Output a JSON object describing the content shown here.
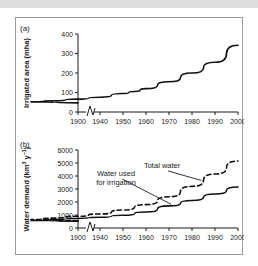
{
  "figure": {
    "panel_a_tag": "(a)",
    "panel_b_tag": "(b)"
  },
  "chart_data": [
    {
      "type": "line",
      "panel": "(a)",
      "title": "",
      "xlabel": "",
      "ylabel": "Irrigated area (mha)",
      "xlim": [
        1900,
        2000
      ],
      "ylim": [
        0,
        400
      ],
      "axis_break_after": 1900,
      "grid": false,
      "legend": "none",
      "xticks": [
        1900,
        1940,
        1950,
        1960,
        1970,
        1980,
        1990,
        2000
      ],
      "xticklabels": [
        "1900",
        "1940",
        "1950",
        "1960",
        "1970",
        "1980",
        "1990",
        "2000"
      ],
      "yticks": [
        0,
        100,
        200,
        300,
        400
      ],
      "yticklabels": [
        "0",
        "100",
        "200",
        "300",
        "400"
      ],
      "series": [
        {
          "name": "Irrigated area",
          "style": "solid",
          "x": [
            1900,
            1910,
            1920,
            1930,
            1940,
            1950,
            1955,
            1960,
            1970,
            1980,
            1990,
            2000
          ],
          "values": [
            47,
            52,
            58,
            66,
            76,
            95,
            105,
            120,
            155,
            200,
            255,
            342
          ]
        }
      ]
    },
    {
      "type": "line",
      "panel": "(b)",
      "title": "",
      "xlabel": "",
      "ylabel": "Water demand (km³ y⁻¹)",
      "xlim": [
        1900,
        2000
      ],
      "ylim": [
        0,
        6000
      ],
      "axis_break_after": 1900,
      "grid": false,
      "legend": "inline-annotations",
      "xticks": [
        1900,
        1940,
        1950,
        1960,
        1970,
        1980,
        1990,
        2000
      ],
      "xticklabels": [
        "1900",
        "1940",
        "1950",
        "1960",
        "1970",
        "1980",
        "1990",
        "2000"
      ],
      "yticks": [
        0,
        1000,
        2000,
        3000,
        4000,
        5000,
        6000
      ],
      "yticklabels": [
        "0",
        "1000",
        "2000",
        "3000",
        "4000",
        "5000",
        "6000"
      ],
      "series": [
        {
          "name": "Total water",
          "style": "dashed",
          "x": [
            1900,
            1910,
            1920,
            1930,
            1940,
            1950,
            1960,
            1970,
            1980,
            1990,
            2000
          ],
          "values": [
            550,
            650,
            760,
            900,
            1080,
            1380,
            1800,
            2400,
            3200,
            4150,
            5150
          ]
        },
        {
          "name": "Water used for irrigation",
          "style": "solid",
          "x": [
            1900,
            1910,
            1920,
            1930,
            1940,
            1950,
            1960,
            1970,
            1980,
            1990,
            2000
          ],
          "values": [
            520,
            580,
            650,
            730,
            830,
            980,
            1230,
            1700,
            2120,
            2620,
            3150
          ]
        }
      ],
      "annotations": [
        {
          "text": "Total water",
          "target_series": "Total water",
          "target_x": 1984,
          "label_x": 1967,
          "label_y": 4620
        },
        {
          "text_line1": "Water used",
          "text_line2": "for irrigation",
          "target_series": "Water used for irrigation",
          "target_x": 1971,
          "label_x": 1947,
          "label_y": 4000
        }
      ]
    }
  ]
}
